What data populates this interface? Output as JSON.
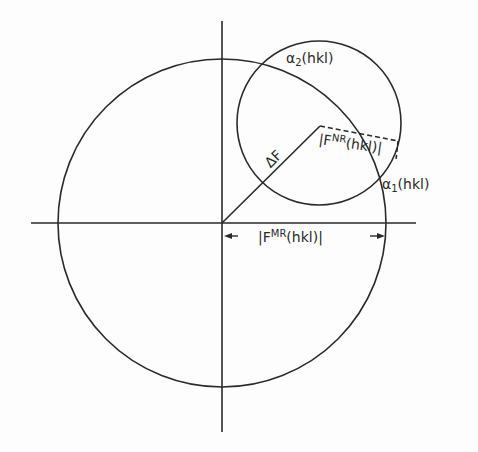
{
  "diagram": {
    "type": "vector-circle-construction",
    "stroke_color": "#2a2a2a",
    "background": "#fdfdfd",
    "labels": {
      "alpha2": {
        "greek": "α",
        "sub": "2",
        "text": "(hkl)"
      },
      "alpha1": {
        "greek": "α",
        "sub": "1",
        "text": "(hkl)"
      },
      "delta_f": "ΔF",
      "fnr": {
        "pre": "|F",
        "sup": "NR",
        "post": "(hkl)|"
      },
      "fmr": {
        "pre": "|F",
        "sup": "MR",
        "post": "(hkl)|"
      }
    },
    "geometry": {
      "origin": [
        222,
        223
      ],
      "large_circle": {
        "cx": 222,
        "cy": 223,
        "r": 164
      },
      "small_circle": {
        "cx": 319,
        "cy": 123,
        "r": 82
      },
      "delta_f_vector": {
        "from": [
          222,
          223
        ],
        "to": [
          320,
          126
        ]
      },
      "fnr_dashed": {
        "from": [
          320,
          126
        ],
        "to": [
          398,
          141
        ]
      },
      "fmr_dimension": {
        "from": [
          222,
          236
        ],
        "to": [
          386,
          236
        ]
      }
    }
  }
}
